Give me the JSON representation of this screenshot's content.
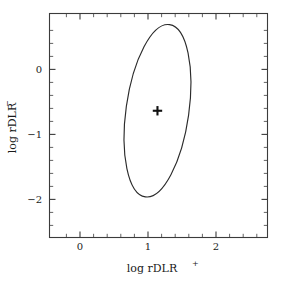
{
  "figure": {
    "background_color": "#ffffff",
    "axis_color": "#3b3b3b",
    "data_color": "#2b2b2b"
  },
  "chart_data": {
    "type": "scatter",
    "title": "",
    "subtitle": "",
    "xlabel": "log rDLR+",
    "xlabel_base": "log rDLR",
    "xlabel_sup": "+",
    "ylabel": "log rDLR−",
    "ylabel_base": "log rDLR",
    "ylabel_sup": "−",
    "xlim": [
      -0.43,
      2.76
    ],
    "ylim": [
      -2.49,
      0.55
    ],
    "xticks": [
      0,
      1,
      2
    ],
    "xtick_labels": [
      "0",
      "1",
      "2"
    ],
    "yticks": [
      0,
      -1,
      -2
    ],
    "ytick_labels": [
      "0",
      "−1",
      "−2"
    ],
    "x_minor_tick_step": 0.2,
    "y_minor_tick_step": 0.2,
    "grid": false,
    "legend": null,
    "legend_position": "none",
    "frame": "full-box",
    "ticks_direction": "in",
    "ticks_on_all_sides": true,
    "series": [
      {
        "name": "point-estimate",
        "type": "scatter",
        "marker": "plus",
        "x": [
          1.15
        ],
        "y": [
          -0.77
        ],
        "color": "#111111"
      },
      {
        "name": "confidence-ellipse",
        "type": "ellipse",
        "center_x": 1.15,
        "center_y": -0.77,
        "semi_axis_x": 0.46,
        "semi_axis_y": 1.18,
        "rotation_deg": 8,
        "color": "#2b2b2b",
        "fill": "none"
      }
    ],
    "annotations": []
  }
}
